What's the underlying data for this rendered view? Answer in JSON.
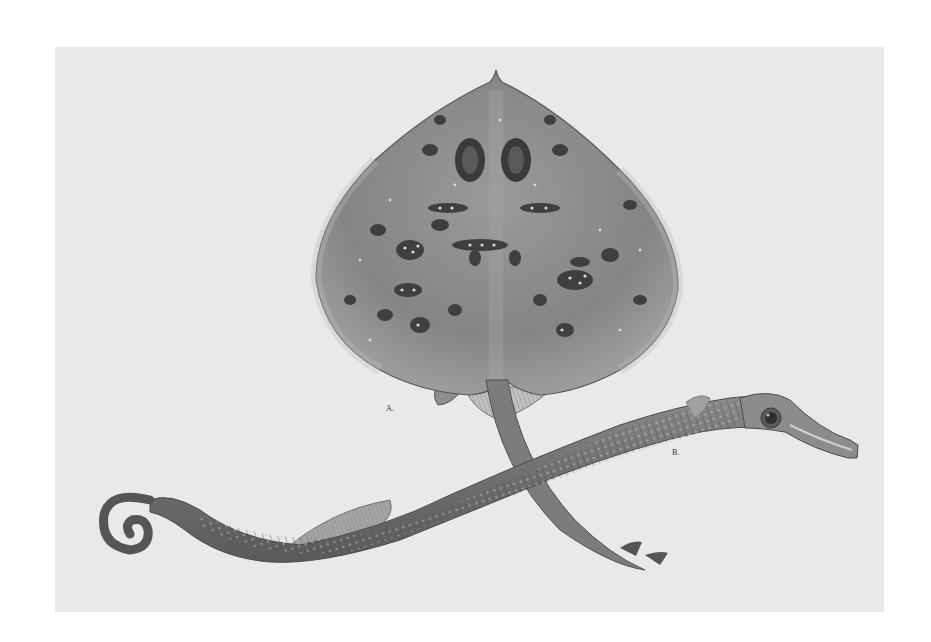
{
  "plate": {
    "background": "#e9e9e9",
    "page_background": "#ffffff",
    "bounds": {
      "left": 55,
      "top": 47,
      "right": 884,
      "bottom": 612
    }
  },
  "figures": [
    {
      "id": "A",
      "label": "A.",
      "subject": "spotted ray (dorsal view)",
      "label_pos": {
        "x": 386,
        "y": 404
      }
    },
    {
      "id": "B",
      "label": "B.",
      "subject": "pipefish with coiled tail",
      "label_pos": {
        "x": 672,
        "y": 448
      }
    }
  ],
  "colors": {
    "ray_body": "#8a8a8a",
    "ray_dark": "#4a4a4a",
    "spot_dark": "#3d3d3d",
    "spot_light": "#d8d8d8",
    "pipefish_body": "#7a7a7a",
    "pipefish_dark": "#4c4c4c",
    "fin": "#a0a0a0"
  }
}
